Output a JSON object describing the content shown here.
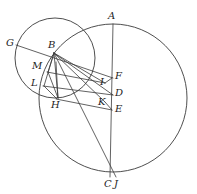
{
  "figure": {
    "kind": "geometry-diagram",
    "width": 197,
    "height": 194,
    "background_color": "#ffffff",
    "stroke_color": "#3a3a3a",
    "label_color": "#1d1d1d"
  },
  "labels": {
    "A": "A",
    "B": "B",
    "C": "C",
    "D": "D",
    "E": "E",
    "F": "F",
    "G": "G",
    "H": "H",
    "I": "I",
    "J": "J",
    "K": "K",
    "L": "L",
    "M": "M"
  },
  "points": [
    {
      "id": "A",
      "label": "A",
      "x": 113,
      "y": 24,
      "label_x": 110,
      "label_y": 11
    },
    {
      "id": "B",
      "label": "B",
      "x": 54,
      "y": 53,
      "label_x": 50,
      "label_y": 41
    },
    {
      "id": "C",
      "label": "C",
      "x": 110,
      "y": 176,
      "label_x": 105,
      "label_y": 180
    },
    {
      "id": "D",
      "label": "D",
      "x": 112,
      "y": 95,
      "label_x": 114,
      "label_y": 89
    },
    {
      "id": "E",
      "label": "E",
      "x": 112,
      "y": 110,
      "label_x": 114,
      "label_y": 105
    },
    {
      "id": "F",
      "label": "F",
      "x": 112,
      "y": 78,
      "label_x": 115,
      "label_y": 72
    },
    {
      "id": "G",
      "label": "G",
      "x": 18,
      "y": 45,
      "label_x": 8,
      "label_y": 39
    },
    {
      "id": "H",
      "label": "H",
      "x": 57,
      "y": 99,
      "label_x": 52,
      "label_y": 100
    },
    {
      "id": "I",
      "label": "I",
      "x": 105,
      "y": 82,
      "label_x": 102,
      "label_y": 77
    },
    {
      "id": "J",
      "label": "J",
      "x": 116,
      "y": 176,
      "label_x": 114,
      "label_y": 180
    },
    {
      "id": "K",
      "label": "K",
      "x": 105,
      "y": 101,
      "label_x": 100,
      "label_y": 97
    },
    {
      "id": "L",
      "label": "L",
      "x": 42,
      "y": 84,
      "label_x": 33,
      "label_y": 78
    },
    {
      "id": "M",
      "label": "M",
      "x": 47,
      "y": 70,
      "label_x": 35,
      "label_y": 62
    }
  ],
  "circles": [
    {
      "id": "small-circle",
      "cx": 55,
      "cy": 58,
      "r": 40
    },
    {
      "id": "large-circle",
      "cx": 113,
      "cy": 98,
      "r": 74
    }
  ],
  "segments": [
    {
      "id": "A-C",
      "from": "A",
      "to": "C"
    },
    {
      "id": "B-J",
      "from": "B",
      "to": "J"
    },
    {
      "id": "G-F",
      "from": "G",
      "to": "F"
    },
    {
      "id": "B-D",
      "from": "B",
      "to": "D"
    },
    {
      "id": "B-I",
      "from": "B",
      "to": "I"
    },
    {
      "id": "B-K",
      "from": "B",
      "to": "K"
    },
    {
      "id": "B-H",
      "from": "B",
      "to": "H"
    },
    {
      "id": "B-L",
      "from": "B",
      "to": "L"
    },
    {
      "id": "B-M",
      "from": "B",
      "to": "M"
    },
    {
      "id": "M-I",
      "from": "M",
      "to": "I"
    },
    {
      "id": "L-D",
      "from": "L",
      "to": "D"
    },
    {
      "id": "H-E",
      "from": "H",
      "to": "E"
    },
    {
      "id": "I-F",
      "from": "I",
      "to": "F"
    },
    {
      "id": "K-E",
      "from": "K",
      "to": "E"
    },
    {
      "id": "L-H",
      "from": "L",
      "to": "H"
    },
    {
      "id": "M-H",
      "from": "M",
      "to": "H"
    }
  ]
}
